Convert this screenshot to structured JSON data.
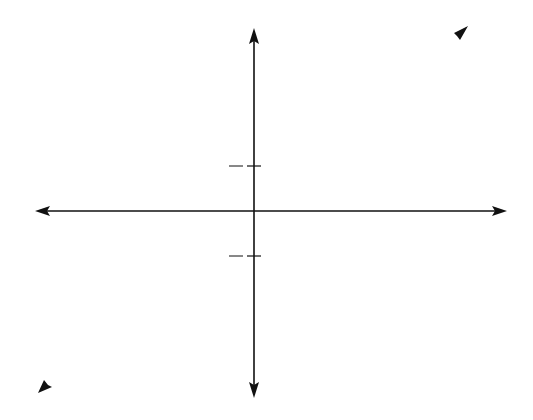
{
  "chart_data": {
    "type": "line",
    "title": "",
    "xlabel": "x",
    "ylabel": "y",
    "grid": true,
    "origin_label": "O",
    "x_tick_labels": [
      "-1",
      "1"
    ],
    "y_tick_labels": [
      "π/2",
      "-π/2"
    ],
    "xlim": [
      -8,
      7.6
    ],
    "ylim": [
      -7.1,
      7.0
    ],
    "series": [
      {
        "name": "y = sin x",
        "label_text": "y = sin x",
        "style": "solid",
        "domain": [
          -6.2832,
          7.07
        ],
        "points": [
          [
            -6.283,
            0
          ],
          [
            -4.712,
            1
          ],
          [
            -3.142,
            0
          ],
          [
            -1.571,
            -1
          ],
          [
            0,
            0
          ],
          [
            1.571,
            1
          ],
          [
            3.142,
            0
          ],
          [
            4.712,
            -1
          ],
          [
            6.283,
            0
          ],
          [
            7.07,
            0.71
          ]
        ]
      },
      {
        "name": "y = arc sin x",
        "label_text": "y = arc sin x",
        "style": "dashed",
        "description": "reflection of y = sin x across y = x (x = sin y), bold dashed",
        "param_range": [
          -7.25,
          6.75
        ],
        "points": [
          [
            0.44,
            6.75
          ],
          [
            -1,
            4.712
          ],
          [
            0,
            3.142
          ],
          [
            1,
            1.571
          ],
          [
            0,
            0
          ],
          [
            -1,
            -1.571
          ],
          [
            0,
            -3.142
          ],
          [
            1,
            -4.712
          ],
          [
            -0.82,
            -7.25
          ]
        ]
      },
      {
        "name": "y = x",
        "label_text": "y = x",
        "style": "dashed-thin",
        "points": [
          [
            -7.1,
            -6.7
          ],
          [
            7.0,
            6.6
          ]
        ]
      }
    ]
  },
  "axes": {
    "x_label": "x",
    "y_label": "y",
    "origin": "O",
    "tick_one": "1",
    "tick_minus_one": "−1",
    "pi": "π",
    "two": "2",
    "minus": "−"
  },
  "labels": {
    "y_eq_x": "y = x",
    "y_eq_sinx_y": "y",
    "y_eq_sinx_rest": " = sin ",
    "y_eq_sinx_x": "x",
    "arcsin_y": "y",
    "arcsin_rest": " = arc sin ",
    "arcsin_x": "x",
    "yx_y": "y",
    "yx_rest": " = ",
    "yx_x": "x"
  },
  "colors": {
    "grid": "#9a9a9a",
    "ink": "#111111",
    "background": "#ffffff"
  }
}
